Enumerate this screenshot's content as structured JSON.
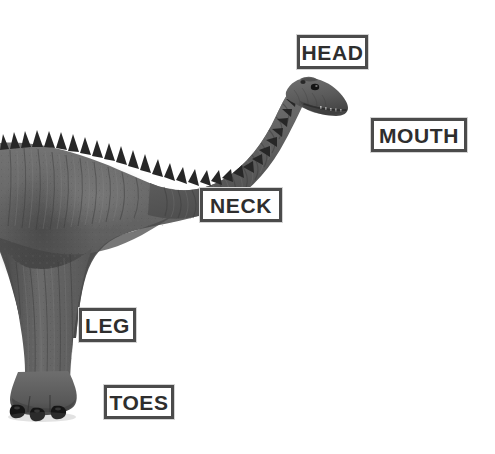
{
  "image": {
    "subject": "sauropod-dinosaur-diagram",
    "description": "Grayscale illustration of a long-necked sauropod dinosaur in side profile facing right, with a row of triangular dorsal spines along the neck and back, standing on a columnar hind leg with three clawed toes.",
    "background_color": "#ffffff",
    "body_color": "#6a6a6a",
    "body_shadow_color": "#3c3c3c",
    "spine_color": "#2b2b2b",
    "claw_color": "#1e1e1e"
  },
  "labels": [
    {
      "id": "head",
      "text": "HEAD",
      "x": 297,
      "y": 35,
      "width": 71,
      "height": 34
    },
    {
      "id": "mouth",
      "text": "MOUTH",
      "x": 371,
      "y": 118,
      "width": 96,
      "height": 34
    },
    {
      "id": "neck",
      "text": "NECK",
      "x": 200,
      "y": 188,
      "width": 82,
      "height": 34
    },
    {
      "id": "leg",
      "text": "LEG",
      "x": 79,
      "y": 308,
      "width": 57,
      "height": 34
    },
    {
      "id": "toes",
      "text": "TOES",
      "x": 104,
      "y": 385,
      "width": 70,
      "height": 34
    }
  ],
  "label_style": {
    "border_color": "#4b4b4b",
    "outer_border_color": "#d4d4d4",
    "text_color": "#2e2e2e",
    "fill_color": "#ffffff"
  }
}
